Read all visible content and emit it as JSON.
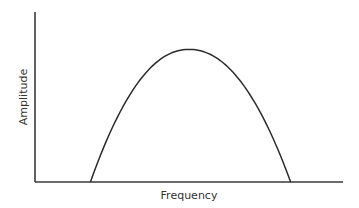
{
  "chart_data": {
    "type": "line",
    "title": "",
    "xlabel": "Frequency",
    "ylabel": "Amplitude",
    "xlim": [
      0,
      1
    ],
    "ylim": [
      0,
      1
    ],
    "grid": false,
    "ticks": false,
    "series": [
      {
        "name": "amplitude-curve",
        "shape": "inverted-parabola",
        "x": [
          0.18,
          0.3,
          0.5,
          0.7,
          0.83
        ],
        "y": [
          0.0,
          0.55,
          0.78,
          0.55,
          0.0
        ],
        "peak": {
          "x": 0.5,
          "y": 0.78
        }
      }
    ]
  }
}
